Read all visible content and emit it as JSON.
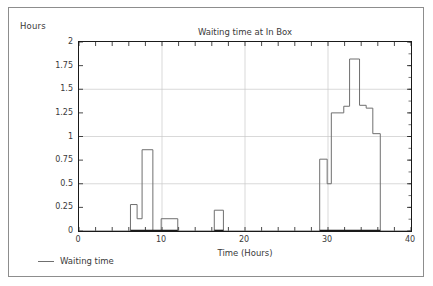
{
  "chart_data": {
    "type": "line",
    "title": "Waiting time at In Box",
    "xlabel": "Time (Hours)",
    "ylabel": "Hours",
    "xlim": [
      0,
      40
    ],
    "ylim": [
      0,
      2
    ],
    "xticks": [
      0,
      10,
      20,
      30,
      40
    ],
    "yticks": [
      0,
      0.25,
      0.5,
      0.75,
      1,
      1.25,
      1.5,
      1.75,
      2
    ],
    "xtick_labels": [
      "0",
      "10",
      "20",
      "30",
      "40"
    ],
    "ytick_labels": [
      "0",
      "0.25",
      "0.5",
      "0.75",
      "1",
      "1.25",
      "1.5",
      "1.75",
      "2"
    ],
    "grid": true,
    "grid_color": "#c9c9c9",
    "line_color": "#6f6f6f",
    "axis_color": "#1a1a1a",
    "drawstyle": "steps-post",
    "legend_position": "below-left",
    "series": [
      {
        "name": "Waiting time",
        "x": [
          0,
          6.2,
          7.0,
          7.6,
          8.9,
          9.9,
          11.9,
          16.3,
          17.4,
          29.0,
          29.9,
          30.4,
          31.9,
          32.6,
          33.8,
          34.6,
          35.4,
          36.3,
          40
        ],
        "values": [
          0,
          0.28,
          0.13,
          0.86,
          0,
          0.13,
          0,
          0.22,
          0,
          0.76,
          0.5,
          1.25,
          1.32,
          1.82,
          1.33,
          1.3,
          1.03,
          0,
          0
        ]
      }
    ]
  },
  "legend": {
    "label": "Waiting time",
    "marker": "line-swatch"
  }
}
